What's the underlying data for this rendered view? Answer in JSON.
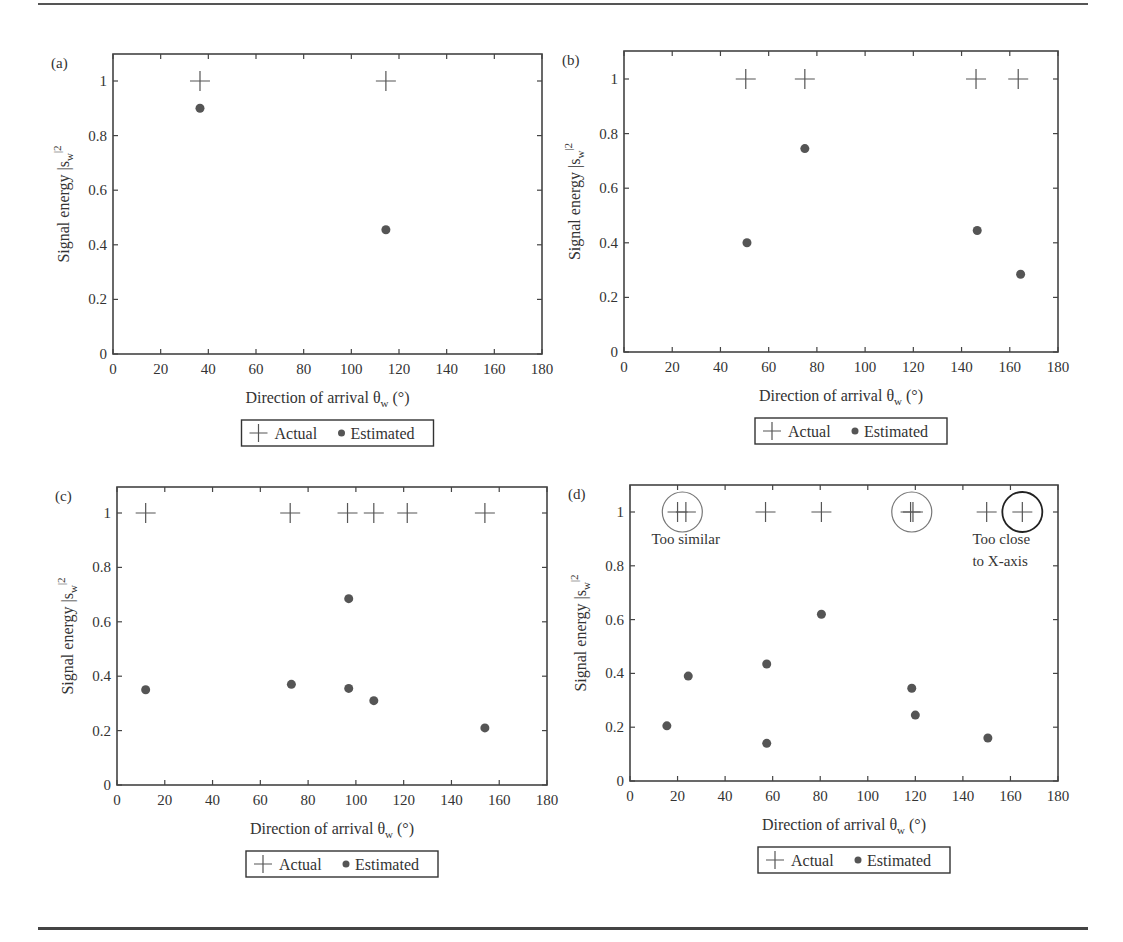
{
  "figure": {
    "legend": {
      "actual_label": "Actual",
      "estimated_label": "Estimated"
    },
    "xlabel": "Direction of arrival θ",
    "xlabel_sub": "w",
    "xlabel_unit": " (°)",
    "ylabel": "Signal energy |s",
    "ylabel_sub": "w",
    "ylabel_sup": "|2"
  },
  "chart_data": [
    {
      "panel": "(a)",
      "type": "scatter",
      "xlabel": "Direction of arrival θw (°)",
      "ylabel": "Signal energy |sw|²",
      "xlim": [
        0,
        180
      ],
      "ylim": [
        0,
        1.1
      ],
      "xticks": [
        0,
        20,
        40,
        60,
        80,
        100,
        120,
        140,
        160,
        180
      ],
      "yticks": [
        0,
        0.2,
        0.4,
        0.6,
        0.8,
        1
      ],
      "ytick_labels": [
        "0",
        "0.2",
        "0.4",
        "0.6",
        "0.8",
        "1"
      ],
      "grid": false,
      "legend_position": "below",
      "series": [
        {
          "name": "Actual",
          "marker": "+",
          "points": [
            [
              36.5,
              1
            ],
            [
              114.5,
              1
            ]
          ]
        },
        {
          "name": "Estimated",
          "marker": "●",
          "points": [
            [
              36.5,
              0.9
            ],
            [
              114.5,
              0.455
            ]
          ]
        }
      ],
      "annotations": []
    },
    {
      "panel": "(b)",
      "type": "scatter",
      "xlabel": "Direction of arrival θw (°)",
      "ylabel": "Signal energy |sw|²",
      "xlim": [
        0,
        180
      ],
      "ylim": [
        0,
        1.1
      ],
      "xticks": [
        0,
        20,
        40,
        60,
        80,
        100,
        120,
        140,
        160,
        180
      ],
      "yticks": [
        0,
        0.2,
        0.4,
        0.6,
        0.8,
        1
      ],
      "ytick_labels": [
        "0",
        "0.2",
        "0.4",
        "0.6",
        "0.8",
        "1"
      ],
      "grid": false,
      "legend_position": "below",
      "series": [
        {
          "name": "Actual",
          "marker": "+",
          "points": [
            [
              50.5,
              1
            ],
            [
              75,
              1
            ],
            [
              146,
              1
            ],
            [
              163.5,
              1
            ]
          ]
        },
        {
          "name": "Estimated",
          "marker": "●",
          "points": [
            [
              51,
              0.4
            ],
            [
              75,
              0.745
            ],
            [
              146.5,
              0.445
            ],
            [
              164.5,
              0.285
            ]
          ]
        }
      ],
      "annotations": []
    },
    {
      "panel": "(c)",
      "type": "scatter",
      "xlabel": "Direction of arrival θw (°)",
      "ylabel": "Signal energy |sw|²",
      "xlim": [
        0,
        180
      ],
      "ylim": [
        0,
        1.1
      ],
      "xticks": [
        0,
        20,
        40,
        60,
        80,
        100,
        120,
        140,
        160,
        180
      ],
      "yticks": [
        0,
        0.2,
        0.4,
        0.6,
        0.8,
        1
      ],
      "ytick_labels": [
        "0",
        "0.2",
        "0.4",
        "0.6",
        "0.8",
        "1"
      ],
      "grid": false,
      "legend_position": "below",
      "series": [
        {
          "name": "Actual",
          "marker": "+",
          "points": [
            [
              12,
              1
            ],
            [
              72.5,
              1
            ],
            [
              96.5,
              1
            ],
            [
              107.5,
              1
            ],
            [
              121.5,
              1
            ],
            [
              154,
              1
            ]
          ]
        },
        {
          "name": "Estimated",
          "marker": "●",
          "points": [
            [
              12,
              0.35
            ],
            [
              73,
              0.37
            ],
            [
              97,
              0.685
            ],
            [
              97,
              0.355
            ],
            [
              107.5,
              0.31
            ],
            [
              154,
              0.21
            ]
          ]
        }
      ],
      "annotations": []
    },
    {
      "panel": "(d)",
      "type": "scatter",
      "xlabel": "Direction of arrival θw (°)",
      "ylabel": "Signal energy |sw|²",
      "xlim": [
        0,
        180
      ],
      "ylim": [
        0,
        1.1
      ],
      "xticks": [
        0,
        20,
        40,
        60,
        80,
        100,
        120,
        140,
        160,
        180
      ],
      "yticks": [
        0,
        0.2,
        0.4,
        0.6,
        0.8,
        1
      ],
      "ytick_labels": [
        "0",
        "0.2",
        "0.4",
        "0.6",
        "0.8",
        "1"
      ],
      "grid": false,
      "legend_position": "below",
      "series": [
        {
          "name": "Actual",
          "marker": "+",
          "points": [
            [
              20,
              1
            ],
            [
              23.5,
              1
            ],
            [
              57,
              1
            ],
            [
              80.5,
              1
            ],
            [
              118,
              1
            ],
            [
              119,
              1
            ],
            [
              150,
              1
            ],
            [
              165,
              1
            ]
          ]
        },
        {
          "name": "Estimated",
          "marker": "●",
          "points": [
            [
              15.5,
              0.205
            ],
            [
              24.5,
              0.39
            ],
            [
              57.5,
              0.435
            ],
            [
              57.5,
              0.14
            ],
            [
              80.5,
              0.62
            ],
            [
              118.5,
              0.345
            ],
            [
              120,
              0.245
            ],
            [
              150.5,
              0.16
            ]
          ]
        }
      ],
      "annotations": [
        {
          "text": "Too similar",
          "circle_center": [
            22,
            1
          ],
          "circle_color": "#777777",
          "text_at": [
            9,
            0.88
          ]
        },
        {
          "text": "",
          "circle_center": [
            118.5,
            1
          ],
          "circle_color": "#777777"
        },
        {
          "text": "Too close\nto X-axis",
          "circle_center": [
            165,
            1
          ],
          "circle_color": "#222222",
          "text_at": [
            144,
            0.88
          ]
        }
      ]
    }
  ],
  "layout_panels": [
    {
      "left": 113,
      "right": 542,
      "top": 54,
      "y0": 354,
      "y1": 81
    },
    {
      "left": 624,
      "right": 1058,
      "top": 51,
      "y0": 352,
      "y1": 79
    },
    {
      "left": 117,
      "right": 547,
      "top": 487,
      "y0": 785,
      "y1": 513
    },
    {
      "left": 630,
      "right": 1058,
      "top": 485,
      "y0": 781,
      "y1": 512
    }
  ]
}
